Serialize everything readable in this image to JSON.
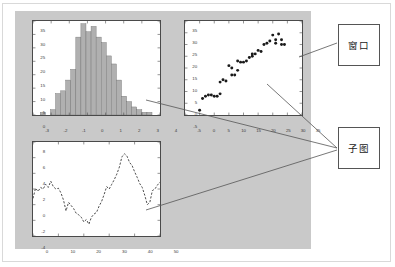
{
  "window": {
    "background_color": "#c9c9c9",
    "axes_edge_color": "#4a4a4a",
    "plot_background": "#ffffff"
  },
  "annotations": {
    "window_label": "窗口",
    "subplot_label": "子图"
  },
  "chart_data": [
    {
      "id": "histogram",
      "type": "bar",
      "title": "",
      "xlabel": "",
      "ylabel": "",
      "xlim": [
        -3,
        4
      ],
      "ylim": [
        0,
        35
      ],
      "xticks": [
        -3,
        -2,
        -1,
        0,
        1,
        2,
        3,
        4
      ],
      "yticks": [
        0,
        5,
        10,
        15,
        20,
        25,
        30,
        35
      ],
      "grid": false,
      "bar_color": "#b0b0b0",
      "bar_edge_color": "#707070",
      "bin_edges": [
        -2.6,
        -2.32,
        -2.04,
        -1.76,
        -1.48,
        -1.2,
        -0.92,
        -0.64,
        -0.36,
        -0.08,
        0.2,
        0.48,
        0.76,
        1.04,
        1.32,
        1.6,
        1.88,
        2.16,
        2.44,
        2.72,
        3.0,
        3.28,
        3.56
      ],
      "categories": [
        -2.46,
        -2.18,
        -1.9,
        -1.62,
        -1.34,
        -1.06,
        -0.78,
        -0.5,
        -0.22,
        0.06,
        0.34,
        0.62,
        0.9,
        1.18,
        1.46,
        1.74,
        2.02,
        2.3,
        2.58,
        2.86,
        3.14,
        3.42
      ],
      "values": [
        1,
        0,
        2,
        8,
        9,
        13,
        17,
        29,
        34,
        31,
        33,
        29,
        27,
        22,
        19,
        13,
        7,
        5,
        3,
        2,
        1,
        1
      ]
    },
    {
      "id": "scatter",
      "type": "scatter",
      "title": "",
      "xlabel": "",
      "ylabel": "",
      "xlim": [
        -5,
        35
      ],
      "ylim": [
        -5,
        35
      ],
      "xticks": [
        -5,
        0,
        5,
        10,
        15,
        20,
        25,
        30,
        35
      ],
      "yticks": [
        -5,
        0,
        5,
        10,
        15,
        20,
        25,
        30,
        35
      ],
      "grid": false,
      "marker_color": "#1a1a1a",
      "marker_size": 2.0,
      "x": [
        0,
        1,
        2,
        3,
        4,
        5,
        6,
        7,
        7,
        8,
        9,
        10,
        11,
        11,
        12,
        13,
        13,
        14,
        15,
        16,
        17,
        18,
        18,
        19,
        20,
        21,
        22,
        23,
        24,
        25,
        26,
        26,
        27,
        28,
        28,
        29
      ],
      "y": [
        -3,
        2,
        3,
        3.5,
        3.5,
        3,
        3,
        4,
        9,
        10,
        9.5,
        16,
        12,
        15,
        12,
        14,
        18,
        17.5,
        17.5,
        18,
        19.5,
        20,
        21,
        21,
        22.5,
        22,
        25,
        25.5,
        26.5,
        29,
        25.5,
        27,
        29.5,
        25,
        27,
        25
      ]
    },
    {
      "id": "lineplot",
      "type": "line",
      "title": "",
      "xlabel": "",
      "ylabel": "",
      "xlim": [
        0,
        50
      ],
      "ylim": [
        -4,
        8
      ],
      "xticks": [
        0,
        10,
        20,
        30,
        40,
        50
      ],
      "yticks": [
        -4,
        -2,
        0,
        2,
        4,
        6,
        8
      ],
      "grid": false,
      "line_color": "#3a3a3a",
      "line_style": "dashed",
      "x": [
        0,
        1,
        2,
        3,
        4,
        5,
        6,
        7,
        8,
        9,
        10,
        11,
        12,
        13,
        14,
        15,
        16,
        17,
        18,
        19,
        20,
        21,
        22,
        23,
        24,
        25,
        26,
        27,
        28,
        29,
        30,
        31,
        32,
        33,
        34,
        35,
        36,
        37,
        38,
        39,
        40,
        41,
        42,
        43,
        44,
        45,
        46,
        47,
        48,
        49,
        50
      ],
      "y": [
        0.8,
        2.1,
        1.7,
        2.2,
        2.0,
        2.6,
        2.2,
        3.0,
        2.3,
        2.0,
        2.1,
        1.5,
        0.6,
        -0.8,
        0.3,
        -0.1,
        -0.5,
        -1.1,
        -1.3,
        -1.6,
        -2.2,
        -1.9,
        -2.5,
        -1.6,
        -1.2,
        -1.0,
        -0.2,
        0.4,
        1.3,
        2.3,
        2.0,
        2.6,
        3.2,
        3.9,
        4.8,
        6.1,
        6.5,
        6.2,
        5.4,
        5.0,
        4.2,
        3.5,
        2.7,
        2.2,
        1.2,
        0.0,
        0.3,
        1.8,
        2.0,
        2.5,
        2.9
      ]
    }
  ]
}
